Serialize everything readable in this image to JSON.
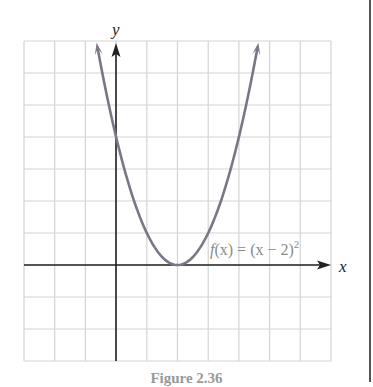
{
  "caption": "Figure 2.36",
  "colors": {
    "grid": "#d4d4d4",
    "axis": "#222222",
    "curve": "#7d7585",
    "label": "#8a8a8a",
    "border": "#555555"
  },
  "chart_data": {
    "type": "line",
    "title": "",
    "function_label": "f(x) = (x − 2)²",
    "xlabel": "x",
    "ylabel": "y",
    "xlim": [
      -3,
      7
    ],
    "ylim": [
      -3,
      7
    ],
    "grid": true,
    "grid_step": 1,
    "tick_labels": false,
    "series": [
      {
        "name": "f(x) = (x − 2)²",
        "x": [
          -0.6,
          -0.5,
          0,
          0.5,
          1,
          1.5,
          2,
          2.5,
          3,
          3.5,
          4,
          4.5,
          4.6
        ],
        "y": [
          6.76,
          6.25,
          4,
          2.25,
          1,
          0.25,
          0,
          0.25,
          1,
          2.25,
          4,
          6.25,
          6.76
        ]
      }
    ],
    "annotations": [
      {
        "text": "f(x) = (x − 2)²",
        "x": 3.2,
        "y": 0.5
      }
    ],
    "vertex": [
      2,
      0
    ],
    "y_intercept": [
      0,
      4
    ]
  },
  "labels": {
    "x_axis": "x",
    "y_axis": "y",
    "func_f": "f",
    "func_rest": "(x) = (x − 2)",
    "func_exp": "2"
  }
}
